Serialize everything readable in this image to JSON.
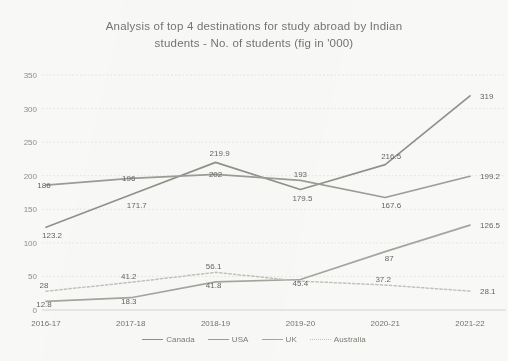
{
  "chart_data": {
    "type": "line",
    "title": "Analysis of top 4 destinations for study abroad by Indian students - No. of students (fig in '000)",
    "title_lines": [
      "Analysis of top 4 destinations for study abroad by Indian",
      "students - No. of students (fig in '000)"
    ],
    "xlabel": "",
    "ylabel": "",
    "categories": [
      "2016-17",
      "2017-18",
      "2018-19",
      "2019-20",
      "2020-21",
      "2021-22"
    ],
    "ylim": [
      0,
      350
    ],
    "yticks": [
      0,
      50,
      100,
      150,
      200,
      250,
      300,
      350
    ],
    "ytick_labels": [
      "0",
      "50",
      "100",
      "150",
      "200",
      "250",
      "300",
      "350"
    ],
    "grid": true,
    "grid_axis": "y",
    "legend_position": "bottom",
    "series": [
      {
        "name": "Canada",
        "color": "#8e8e88",
        "style": "solid",
        "values": [
          123.2,
          171.7,
          219.9,
          179.5,
          216.5,
          319
        ],
        "labels": [
          "123.2",
          "171.7",
          "219.9",
          "179.5",
          "216.5",
          "319"
        ]
      },
      {
        "name": "USA",
        "color": "#9a9a93",
        "style": "solid",
        "values": [
          186,
          196,
          202,
          193,
          167.6,
          199.2
        ],
        "labels": [
          "186",
          "196",
          "202",
          "193",
          "167.6",
          "199.2"
        ]
      },
      {
        "name": "UK",
        "color": "#a3a39c",
        "style": "solid",
        "values": [
          12.8,
          18.3,
          41.8,
          45.4,
          87,
          126.5
        ],
        "labels": [
          "12.8",
          "18.3",
          "41.8",
          "45.4",
          "87",
          "126.5"
        ]
      },
      {
        "name": "Australia",
        "color": "#c2c2bb",
        "style": "dotted",
        "values": [
          28,
          41.2,
          56.1,
          43.0,
          37.2,
          28.1
        ],
        "labels": [
          "28",
          "41.2",
          "56.1",
          "",
          "37.2",
          "28.1"
        ]
      }
    ]
  }
}
